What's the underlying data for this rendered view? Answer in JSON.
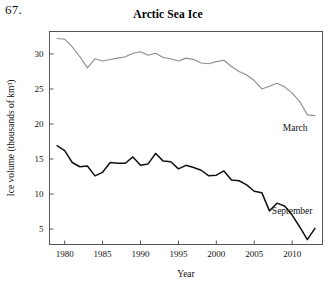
{
  "figure": {
    "problem_number": "67.",
    "title": "Arctic Sea Ice"
  },
  "labels": {
    "x_axis_title": "Year",
    "y_axis_title": "Ice volume (thousands of km³)",
    "series_march": "March",
    "series_september": "September"
  },
  "colors": {
    "march_line": "#8d8d8d",
    "september_line": "#111111",
    "axis": "#555555",
    "text": "#111111",
    "background": "#ffffff"
  },
  "chart_data": {
    "type": "line",
    "title": "Arctic Sea Ice",
    "xlabel": "Year",
    "ylabel": "Ice volume (thousands of km³)",
    "xlim": [
      1978,
      2014
    ],
    "ylim": [
      2.8,
      33.2
    ],
    "xticks": [
      1980,
      1985,
      1990,
      1995,
      2000,
      2005,
      2010
    ],
    "yticks": [
      5,
      10,
      15,
      20,
      25,
      30
    ],
    "grid": false,
    "legend": "inline-annotations",
    "x": [
      1979,
      1980,
      1981,
      1982,
      1983,
      1984,
      1985,
      1986,
      1987,
      1988,
      1989,
      1990,
      1991,
      1992,
      1993,
      1994,
      1995,
      1996,
      1997,
      1998,
      1999,
      2000,
      2001,
      2002,
      2003,
      2004,
      2005,
      2006,
      2007,
      2008,
      2009,
      2010,
      2011,
      2012,
      2013
    ],
    "series": [
      {
        "name": "March",
        "color": "#8d8d8d",
        "values": [
          32.2,
          32.1,
          31.0,
          29.6,
          28.0,
          29.3,
          29.0,
          29.2,
          29.4,
          29.6,
          30.1,
          30.3,
          29.8,
          30.1,
          29.5,
          29.3,
          29.0,
          29.4,
          29.2,
          28.7,
          28.6,
          28.9,
          29.1,
          28.2,
          27.5,
          27.0,
          26.2,
          25.0,
          25.4,
          25.8,
          25.3,
          24.4,
          23.2,
          21.3,
          21.2
        ]
      },
      {
        "name": "September",
        "color": "#111111",
        "values": [
          16.9,
          16.2,
          14.5,
          13.9,
          14.0,
          12.6,
          13.1,
          14.5,
          14.4,
          14.4,
          15.3,
          14.1,
          14.3,
          15.8,
          14.7,
          14.6,
          13.6,
          14.1,
          13.8,
          13.4,
          12.6,
          12.7,
          13.3,
          12.0,
          11.9,
          11.3,
          10.4,
          10.2,
          7.6,
          8.7,
          8.3,
          7.0,
          5.3,
          3.5,
          5.1
        ]
      }
    ],
    "annotations": [
      {
        "text": "March",
        "x": 2010.4,
        "y": 19.0
      },
      {
        "text": "September",
        "x": 2010.0,
        "y": 7.2
      }
    ]
  }
}
